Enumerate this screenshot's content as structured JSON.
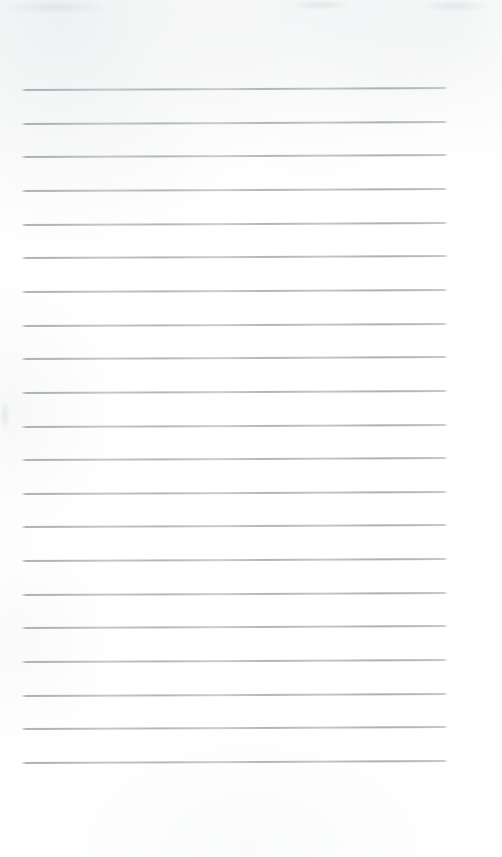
{
  "document": {
    "type": "scanned-page",
    "kind": "blank ruled notepad page",
    "title": "",
    "body_text": "",
    "has_handwriting": false,
    "has_printed_text": false,
    "page_number": "",
    "header_text": "",
    "footer_text": ""
  },
  "canvas": {
    "width_px": 502,
    "height_px": 857,
    "background_color": "#ffffff",
    "paper_tone": "#fdfdfd"
  },
  "ruling": {
    "line_color": "#b0b5b8",
    "line_thickness_px": 1,
    "line_count": 21,
    "first_line_y": 90,
    "line_spacing_px": 33.65,
    "left_margin_x": 21,
    "right_end_x": 448,
    "line_length_px": 427,
    "slant_rise_px": -2,
    "top_blank_px": 90,
    "bottom_blank_px": 94,
    "lines": [
      {
        "index": 1,
        "y": 90,
        "x_start": 21,
        "x_end": 448
      },
      {
        "index": 2,
        "y": 124,
        "x_start": 21,
        "x_end": 448
      },
      {
        "index": 3,
        "y": 157,
        "x_start": 21,
        "x_end": 448
      },
      {
        "index": 4,
        "y": 191,
        "x_start": 21,
        "x_end": 448
      },
      {
        "index": 5,
        "y": 225,
        "x_start": 21,
        "x_end": 448
      },
      {
        "index": 6,
        "y": 258,
        "x_start": 21,
        "x_end": 448
      },
      {
        "index": 7,
        "y": 292,
        "x_start": 21,
        "x_end": 448
      },
      {
        "index": 8,
        "y": 326,
        "x_start": 21,
        "x_end": 448
      },
      {
        "index": 9,
        "y": 359,
        "x_start": 21,
        "x_end": 448
      },
      {
        "index": 10,
        "y": 393,
        "x_start": 21,
        "x_end": 448
      },
      {
        "index": 11,
        "y": 427,
        "x_start": 21,
        "x_end": 448
      },
      {
        "index": 12,
        "y": 460,
        "x_start": 21,
        "x_end": 448
      },
      {
        "index": 13,
        "y": 494,
        "x_start": 21,
        "x_end": 448
      },
      {
        "index": 14,
        "y": 527,
        "x_start": 21,
        "x_end": 448
      },
      {
        "index": 15,
        "y": 561,
        "x_start": 21,
        "x_end": 448
      },
      {
        "index": 16,
        "y": 595,
        "x_start": 21,
        "x_end": 448
      },
      {
        "index": 17,
        "y": 628,
        "x_start": 21,
        "x_end": 448
      },
      {
        "index": 18,
        "y": 662,
        "x_start": 21,
        "x_end": 448
      },
      {
        "index": 19,
        "y": 696,
        "x_start": 21,
        "x_end": 448
      },
      {
        "index": 20,
        "y": 729,
        "x_start": 21,
        "x_end": 448
      },
      {
        "index": 21,
        "y": 763,
        "x_start": 21,
        "x_end": 448
      }
    ]
  },
  "artifacts": {
    "description": "faint grey scanner smudges along the top edge and left edge",
    "regions": [
      {
        "name": "top-left-smudge",
        "x": 0,
        "y": 0,
        "width": 110,
        "height": 14
      },
      {
        "name": "top-center-smudge",
        "x": 290,
        "y": 0,
        "width": 60,
        "height": 10
      },
      {
        "name": "top-right-smudge",
        "x": 420,
        "y": 0,
        "width": 70,
        "height": 12
      },
      {
        "name": "left-edge-smudge",
        "x": 0,
        "y": 400,
        "width": 10,
        "height": 30
      }
    ]
  }
}
